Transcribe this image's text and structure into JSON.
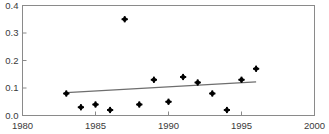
{
  "chart_data": {
    "type": "scatter",
    "title": "",
    "xlabel": "",
    "ylabel": "",
    "xlim": [
      1980,
      2000
    ],
    "ylim": [
      0.0,
      0.4
    ],
    "grid": false,
    "legend": null,
    "xticks": [
      "1980",
      "1985",
      "1990",
      "1995",
      "2000"
    ],
    "xtick_values": [
      1980,
      1985,
      1990,
      1995,
      2000
    ],
    "yticks": [
      "0.0",
      "0.1",
      "0.2",
      "0.3",
      "0.4"
    ],
    "ytick_values": [
      0.0,
      0.1,
      0.2,
      0.3,
      0.4
    ],
    "marker": "diamond",
    "marker_color": "#000000",
    "x": [
      1983,
      1984,
      1985,
      1986,
      1987,
      1988,
      1989,
      1990,
      1991,
      1992,
      1993,
      1994,
      1995,
      1996
    ],
    "y": [
      0.08,
      0.03,
      0.04,
      0.02,
      0.35,
      0.04,
      0.13,
      0.05,
      0.14,
      0.12,
      0.08,
      0.02,
      0.13,
      0.17
    ],
    "points": [
      {
        "x": 1983,
        "y": 0.08
      },
      {
        "x": 1984,
        "y": 0.03
      },
      {
        "x": 1985,
        "y": 0.04
      },
      {
        "x": 1986,
        "y": 0.02
      },
      {
        "x": 1987,
        "y": 0.35
      },
      {
        "x": 1988,
        "y": 0.04
      },
      {
        "x": 1989,
        "y": 0.13
      },
      {
        "x": 1990,
        "y": 0.05
      },
      {
        "x": 1991,
        "y": 0.14
      },
      {
        "x": 1992,
        "y": 0.12
      },
      {
        "x": 1993,
        "y": 0.08
      },
      {
        "x": 1994,
        "y": 0.02
      },
      {
        "x": 1995,
        "y": 0.13
      },
      {
        "x": 1996,
        "y": 0.17
      }
    ],
    "trendline": {
      "name": "linear-fit",
      "color": "#6e6e6e",
      "x_start": 1983,
      "y_start": 0.083,
      "x_end": 1996,
      "y_end": 0.122
    },
    "axis_color": "#8a8a8a",
    "background": "#ffffff"
  },
  "figure": {
    "clipped_title": ""
  }
}
